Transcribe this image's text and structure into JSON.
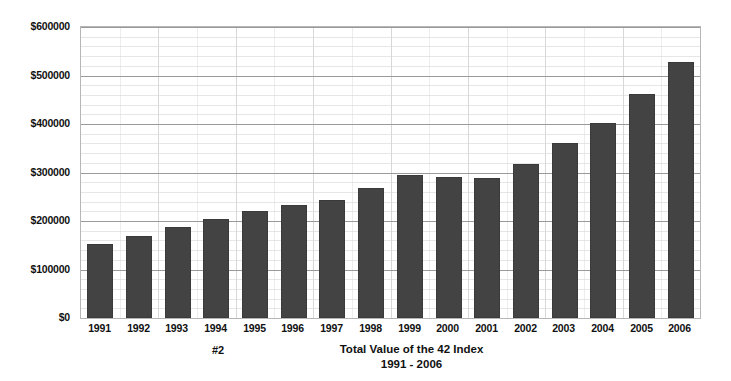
{
  "chart_data": {
    "type": "bar",
    "title": "Total Value of the 42 Index",
    "subtitle": "1991 - 2006",
    "annotation": "#2",
    "xlabel": "",
    "ylabel": "",
    "grid": true,
    "legend": "none",
    "ylim": [
      0,
      600000
    ],
    "y_major_step": 100000,
    "y_minor_step": 20000,
    "y_tick_labels": [
      "$0",
      "$100000",
      "$200000",
      "$300000",
      "$400000",
      "$500000",
      "$600000"
    ],
    "y_tick_values": [
      0,
      100000,
      200000,
      300000,
      400000,
      500000,
      600000
    ],
    "categories": [
      "1991",
      "1992",
      "1993",
      "1994",
      "1995",
      "1996",
      "1997",
      "1998",
      "1999",
      "2000",
      "2001",
      "2002",
      "2003",
      "2004",
      "2005",
      "2006"
    ],
    "values": [
      152000,
      169000,
      187000,
      205000,
      221000,
      232000,
      243000,
      268000,
      294000,
      291000,
      288000,
      318000,
      360000,
      403000,
      461000,
      528000
    ],
    "series": [
      {
        "name": "Total Value",
        "values": [
          152000,
          169000,
          187000,
          205000,
          221000,
          232000,
          243000,
          268000,
          294000,
          291000,
          288000,
          318000,
          360000,
          403000,
          461000,
          528000
        ]
      }
    ],
    "bar_color": "#434343",
    "plot_border_color": "#b6b6b6",
    "major_gridline_color": "#9a9a9a",
    "minor_gridline_color": "#e6e6e6",
    "background_color": "#ffffff"
  }
}
